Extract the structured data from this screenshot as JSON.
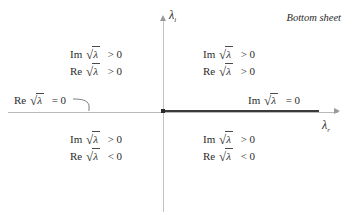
{
  "figure": {
    "caption": "Bottom sheet",
    "axes": {
      "vertical_label_base": "λ",
      "vertical_label_sub": "i",
      "horizontal_label_base": "λ",
      "horizontal_label_sub": "r",
      "branch_cut_note": "positive real axis drawn heavy (branch cut)"
    },
    "symbols": {
      "surd": "√",
      "lambda": "λ",
      "im": "Im",
      "re": "Re",
      "greater": "> 0",
      "less": "< 0",
      "equal": "= 0"
    },
    "quadrants": [
      {
        "id": "upper-left",
        "line1_fn": "Im",
        "line1_rel": "> 0",
        "line2_fn": "Re",
        "line2_rel": "> 0"
      },
      {
        "id": "upper-right",
        "line1_fn": "Im",
        "line1_rel": "> 0",
        "line2_fn": "Re",
        "line2_rel": "> 0"
      },
      {
        "id": "lower-left",
        "line1_fn": "Im",
        "line1_rel": "> 0",
        "line2_fn": "Re",
        "line2_rel": "< 0"
      },
      {
        "id": "lower-right",
        "line1_fn": "Im",
        "line1_rel": "> 0",
        "line2_fn": "Re",
        "line2_rel": "< 0"
      }
    ],
    "callouts": [
      {
        "id": "negative-real-axis",
        "fn": "Re",
        "rel": "= 0"
      },
      {
        "id": "positive-real-axis",
        "fn": "Im",
        "rel": "= 0"
      }
    ],
    "colors": {
      "background": "#ffffff",
      "axis": "#b9b9b9",
      "branch_cut": "#3a3a3a",
      "text": "#2b2b2b"
    }
  }
}
